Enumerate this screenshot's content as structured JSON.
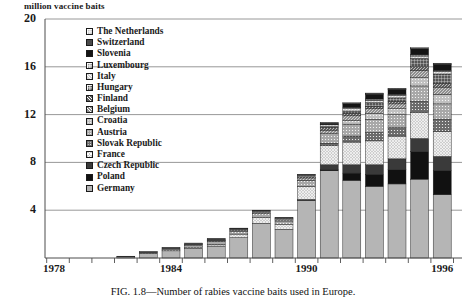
{
  "axis_title": "million vaccine baits",
  "caption": "FIG. 1.8—Number of rabies vaccine baits used in Europe.",
  "yticks": [
    "0",
    "4",
    "8",
    "12",
    "16",
    "20"
  ],
  "xticks": [
    "1978",
    "1984",
    "1990",
    "1996"
  ],
  "legend": [
    {
      "label": "The Netherlands",
      "pattern": "light-grid",
      "color": "#c9c9c9"
    },
    {
      "label": "Switzerland",
      "pattern": "dark-solid",
      "color": "#4a4a4a"
    },
    {
      "label": "Slovenia",
      "pattern": "black",
      "color": "#141414"
    },
    {
      "label": "Luxembourg",
      "pattern": "medium-grid",
      "color": "#9a9a9a"
    },
    {
      "label": "Italy",
      "pattern": "light-hatch",
      "color": "#d2d2d2"
    },
    {
      "label": "Hungary",
      "pattern": "dark-grid",
      "color": "#555555"
    },
    {
      "label": "Finland",
      "pattern": "dark-hatch",
      "color": "#5f5f5f"
    },
    {
      "label": "Belgium",
      "pattern": "medium-hatch",
      "color": "#8e8e8e"
    },
    {
      "label": "Croatia",
      "pattern": "light-dot",
      "color": "#c0c0c0"
    },
    {
      "label": "Austria",
      "pattern": "medium-dot",
      "color": "#a8a8a8"
    },
    {
      "label": "Slovak Republic",
      "pattern": "dark-dot",
      "color": "#6b6b6b"
    },
    {
      "label": "France",
      "pattern": "light-cross",
      "color": "#cdcdcd"
    },
    {
      "label": "Czech Republic",
      "pattern": "very-dark",
      "color": "#3a3a3a"
    },
    {
      "label": "Poland",
      "pattern": "black-solid",
      "color": "#111111"
    },
    {
      "label": "Germany",
      "pattern": "grey-fill",
      "color": "#b5b5b5"
    }
  ],
  "chart_data": {
    "type": "bar",
    "subtype": "stacked-bar",
    "title": "",
    "caption": "FIG. 1.8—Number of rabies vaccine baits used in Europe.",
    "xlabel": "",
    "ylabel": "million vaccine baits",
    "ylim": [
      0,
      20
    ],
    "yticks": [
      0,
      4,
      8,
      12,
      16,
      20
    ],
    "grid": "horizontal",
    "legend_position": "upper-left-inside",
    "x": [
      1979,
      1980,
      1981,
      1982,
      1983,
      1984,
      1985,
      1986,
      1987,
      1988,
      1989,
      1990,
      1991,
      1992,
      1993,
      1994,
      1995,
      1996
    ],
    "xtick_labels": [
      "1978",
      "1984",
      "1990",
      "1996"
    ],
    "totals": [
      0,
      0,
      0,
      0.15,
      0.55,
      0.9,
      1.25,
      1.65,
      2.5,
      4.0,
      3.5,
      7.0,
      11.3,
      12.6,
      13.4,
      13.6,
      17.3,
      16.3
    ],
    "series": [
      {
        "name": "Germany",
        "values": [
          0,
          0,
          0,
          0.1,
          0.4,
          0.6,
          0.8,
          1.0,
          1.7,
          2.9,
          2.4,
          4.8,
          7.3,
          6.5,
          6.0,
          6.2,
          6.6,
          5.3
        ]
      },
      {
        "name": "Poland",
        "values": [
          0,
          0,
          0,
          0,
          0,
          0,
          0,
          0,
          0,
          0,
          0,
          0,
          0.1,
          0.6,
          1.0,
          1.2,
          2.3,
          2.0
        ]
      },
      {
        "name": "Czech Republic",
        "values": [
          0,
          0,
          0,
          0,
          0,
          0,
          0,
          0,
          0,
          0,
          0,
          0.1,
          0.4,
          0.7,
          0.8,
          0.9,
          1.1,
          1.2
        ]
      },
      {
        "name": "France",
        "values": [
          0,
          0,
          0,
          0,
          0,
          0,
          0.05,
          0.15,
          0.3,
          0.5,
          0.4,
          1.1,
          1.6,
          1.9,
          2.0,
          1.9,
          2.2,
          2.1
        ]
      },
      {
        "name": "Slovak Republic",
        "values": [
          0,
          0,
          0,
          0,
          0,
          0,
          0,
          0,
          0,
          0,
          0,
          0,
          0.2,
          0.5,
          0.7,
          0.7,
          0.9,
          1.0
        ]
      },
      {
        "name": "Austria",
        "values": [
          0,
          0,
          0,
          0,
          0.05,
          0.15,
          0.2,
          0.25,
          0.25,
          0.3,
          0.3,
          0.5,
          0.8,
          1.0,
          1.1,
          1.1,
          1.3,
          1.3
        ]
      },
      {
        "name": "Croatia",
        "values": [
          0,
          0,
          0,
          0,
          0,
          0,
          0,
          0,
          0,
          0,
          0,
          0,
          0,
          0.3,
          0.5,
          0.5,
          0.7,
          0.8
        ]
      },
      {
        "name": "Belgium",
        "values": [
          0,
          0,
          0,
          0,
          0,
          0,
          0,
          0.05,
          0.1,
          0.1,
          0.1,
          0.2,
          0.3,
          0.4,
          0.4,
          0.4,
          0.6,
          0.6
        ]
      },
      {
        "name": "Finland",
        "values": [
          0,
          0,
          0,
          0,
          0,
          0,
          0,
          0,
          0,
          0,
          0,
          0.1,
          0.2,
          0.2,
          0.2,
          0.2,
          0.3,
          0.3
        ]
      },
      {
        "name": "Hungary",
        "values": [
          0,
          0,
          0,
          0,
          0,
          0,
          0,
          0,
          0,
          0,
          0,
          0,
          0.1,
          0.2,
          0.3,
          0.3,
          0.7,
          0.8
        ]
      },
      {
        "name": "Italy",
        "values": [
          0,
          0,
          0,
          0,
          0,
          0,
          0.05,
          0.05,
          0.05,
          0.1,
          0.1,
          0.1,
          0.15,
          0.2,
          0.2,
          0.2,
          0.2,
          0.2
        ]
      },
      {
        "name": "Luxembourg",
        "values": [
          0,
          0,
          0,
          0,
          0,
          0,
          0,
          0.05,
          0.05,
          0.05,
          0.05,
          0.05,
          0.05,
          0.1,
          0.1,
          0.1,
          0.1,
          0.1
        ]
      },
      {
        "name": "Slovenia",
        "values": [
          0,
          0,
          0,
          0,
          0,
          0,
          0,
          0,
          0,
          0,
          0,
          0,
          0.05,
          0.3,
          0.4,
          0.4,
          0.5,
          0.5
        ]
      },
      {
        "name": "Switzerland",
        "values": [
          0,
          0,
          0,
          0.05,
          0.1,
          0.15,
          0.15,
          0.1,
          0.05,
          0.05,
          0.05,
          0.05,
          0.05,
          0.05,
          0.05,
          0.05,
          0.05,
          0.05
        ]
      },
      {
        "name": "The Netherlands",
        "values": [
          0,
          0,
          0,
          0,
          0,
          0,
          0,
          0,
          0,
          0,
          0,
          0,
          0.05,
          0.05,
          0.05,
          0.05,
          0.05,
          0.05
        ]
      }
    ]
  },
  "geometry": {
    "plot_left": 45,
    "plot_right": 462,
    "y_zero_px": 258,
    "y_top_px": 19,
    "y_max_value": 20,
    "bar_width": 18,
    "bar_gap": 4.6,
    "first_bar_left": 49
  }
}
